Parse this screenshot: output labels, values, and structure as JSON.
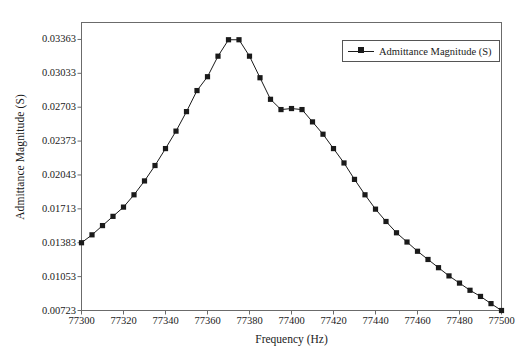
{
  "chart_data": {
    "type": "line",
    "title": "",
    "xlabel": "Frequency (Hz)",
    "ylabel": "Admittance Magnitude (S)",
    "xlim": [
      77300,
      77500
    ],
    "ylim": [
      0.00723,
      0.03528
    ],
    "xticks": [
      77300,
      77320,
      77340,
      77360,
      77380,
      77400,
      77420,
      77440,
      77460,
      77480,
      77500
    ],
    "yticks": [
      0.00723,
      0.01053,
      0.01383,
      0.01713,
      0.02043,
      0.02373,
      0.02703,
      0.03033,
      0.03363
    ],
    "grid": false,
    "legend_position": "top-right",
    "marker": "square",
    "line_color": "#1a1a1a",
    "marker_color": "#1a1a1a",
    "series": [
      {
        "name": "Admittance Magnitude (S)",
        "x": [
          77300,
          77305,
          77310,
          77315,
          77320,
          77325,
          77330,
          77335,
          77340,
          77345,
          77350,
          77355,
          77360,
          77365,
          77370,
          77375,
          77380,
          77385,
          77390,
          77395,
          77400,
          77405,
          77410,
          77415,
          77420,
          77425,
          77430,
          77435,
          77440,
          77445,
          77450,
          77455,
          77460,
          77465,
          77470,
          77475,
          77480,
          77485,
          77490,
          77495,
          77500
        ],
        "values": [
          0.01383,
          0.0146,
          0.0155,
          0.0164,
          0.0173,
          0.0185,
          0.01985,
          0.02135,
          0.023,
          0.0247,
          0.0266,
          0.02865,
          0.03,
          0.032,
          0.0336,
          0.0336,
          0.032,
          0.0299,
          0.0278,
          0.0268,
          0.0269,
          0.0268,
          0.0256,
          0.0244,
          0.023,
          0.0216,
          0.02,
          0.0185,
          0.0171,
          0.0159,
          0.0148,
          0.0139,
          0.013,
          0.0122,
          0.0114,
          0.0106,
          0.0099,
          0.0092,
          0.0086,
          0.0079,
          0.00723
        ]
      }
    ]
  },
  "legend": {
    "entries": [
      {
        "label": "Admittance Magnitude (S)"
      }
    ]
  }
}
